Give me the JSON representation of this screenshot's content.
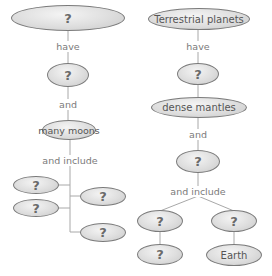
{
  "colors": {
    "line": "#a0a0a0",
    "oval_border": "#7a7a7a",
    "oval_fill": "#dedede",
    "text": "#555555"
  },
  "left_map": {
    "top": "?",
    "link1": "have",
    "node2": "?",
    "link2": "and",
    "node3": "many moons",
    "link3": "and include",
    "branches": [
      "?",
      "?",
      "?",
      "?"
    ]
  },
  "right_map": {
    "top": "Terrestrial planets",
    "link1": "have",
    "node2": "?",
    "node3": "dense mantles",
    "link2": "and",
    "node4": "?",
    "link3": "and include",
    "left_branch": [
      "?",
      "?"
    ],
    "right_branch": [
      "?",
      "Earth"
    ]
  }
}
